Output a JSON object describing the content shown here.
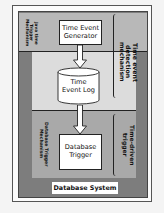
{
  "diagram": {
    "system_label": "Database System",
    "left_labels": {
      "top": "Java time\nTrigger\nMechanism",
      "bottom": "Database Trigger\nMechanism"
    },
    "right_labels": {
      "top": "Time event\ndetection mechanism",
      "bottom": "Time-driven trigger"
    },
    "nodes": {
      "generator": "Time Event\nGenerator",
      "log": "Time\nEvent Log",
      "trigger": "Database\nTrigger"
    },
    "edges": [
      {
        "from": "Time Event Generator",
        "to": "Time Event Log"
      },
      {
        "from": "Time Event Log",
        "to": "Database Trigger"
      }
    ],
    "colors": {
      "outer_panel": "#7d7d7d",
      "top_band": "#b8b8b8",
      "middle_band": "#dcdcdc",
      "bottom_band": "#a9a9a9",
      "box_fill": "#ffffff",
      "stroke": "#222222"
    }
  }
}
